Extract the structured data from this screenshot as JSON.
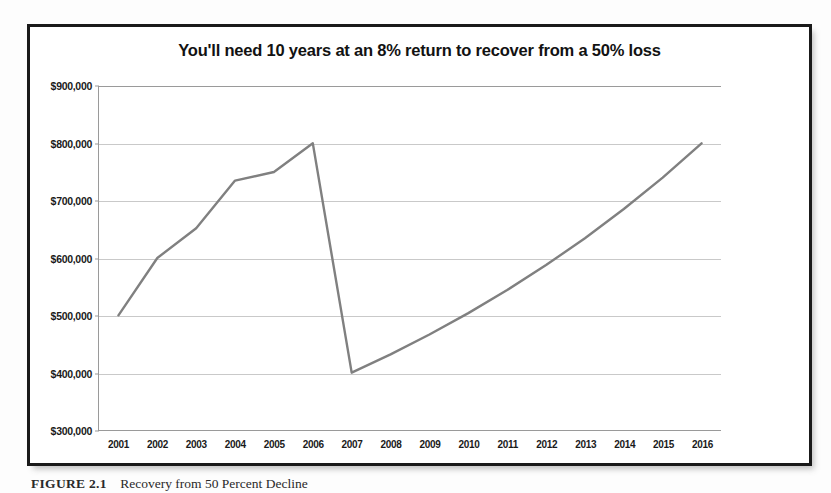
{
  "figure": {
    "caption_label": "FIGURE 2.1",
    "caption_text": "Recovery from 50 Percent Decline"
  },
  "chart_data": {
    "type": "line",
    "title": "You'll need 10 years at an 8% return to recover from a 50% loss",
    "xlabel": "",
    "ylabel": "",
    "categories": [
      "2001",
      "2002",
      "2003",
      "2004",
      "2005",
      "2006",
      "2007",
      "2008",
      "2009",
      "2010",
      "2011",
      "2012",
      "2013",
      "2014",
      "2015",
      "2016"
    ],
    "values": [
      500000,
      600000,
      652000,
      735000,
      750000,
      800000,
      400000,
      432000,
      466560,
      503800,
      544100,
      587600,
      634600,
      685400,
      740200,
      800000
    ],
    "series": [
      {
        "name": "Portfolio value",
        "color": "#808080",
        "values": [
          500000,
          600000,
          652000,
          735000,
          750000,
          800000,
          400000,
          432000,
          466560,
          503800,
          544100,
          587600,
          634600,
          685400,
          740200,
          800000
        ]
      }
    ],
    "ylim": [
      300000,
      900000
    ],
    "ytick_values": [
      900000,
      800000,
      700000,
      600000,
      500000,
      400000,
      300000
    ],
    "ytick_labels": [
      "$900,000",
      "$800,000",
      "$700,000",
      "$600,000",
      "$500,000",
      "$400,000",
      "$300,000"
    ],
    "grid": true,
    "legend": "none",
    "annotations": [
      "Peak of $800,000 reached in 2006",
      "50% loss to $400,000 in 2007",
      "8% annual return restores $800,000 by 2016"
    ]
  }
}
